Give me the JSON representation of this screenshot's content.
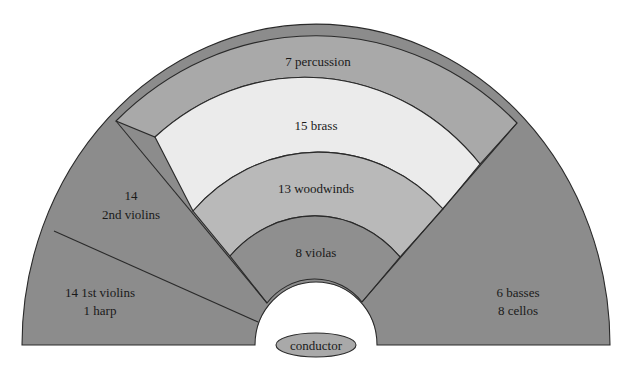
{
  "diagram": {
    "type": "orchestra-seating-chart",
    "sections": [
      {
        "id": "percussion",
        "label": "7 percussion",
        "color": "#a9a9a9"
      },
      {
        "id": "brass",
        "label": "15 brass",
        "color": "#ebebeb"
      },
      {
        "id": "woodwinds",
        "label": "13 woodwinds",
        "color": "#b9b9b9"
      },
      {
        "id": "violas",
        "label": "8 violas",
        "color": "#8f8f8f"
      },
      {
        "id": "second-violins",
        "label_line1": "14",
        "label_line2": "2nd violins",
        "color": "#8c8c8c"
      },
      {
        "id": "first-violins",
        "label_line1": "14 1st violins",
        "label_line2": "1 harp",
        "color": "#8c8c8c"
      },
      {
        "id": "basses-cellos",
        "label_line1": "6 basses",
        "label_line2": "8 cellos",
        "color": "#8c8c8c"
      }
    ],
    "conductor": {
      "label": "conductor",
      "color": "#a9a9a9"
    }
  }
}
